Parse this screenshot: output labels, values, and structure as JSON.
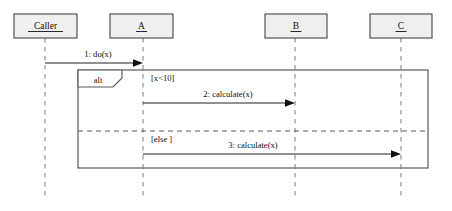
{
  "diagram": {
    "type": "uml-sequence-diagram",
    "title": "",
    "width": 452,
    "height": 211,
    "colors": {
      "background": "#ffffff",
      "lifeline_box_fill": "#efefef",
      "lifeline_box_stroke": "#444444",
      "lifeline_dash": "#9a9a9a",
      "fragment_stroke": "#5a5a5a",
      "message_stroke": "#222222",
      "text": "#111111"
    }
  },
  "lifelines": [
    {
      "id": "caller",
      "label": "Caller",
      "underlined": true,
      "x": 45,
      "box": {
        "x": 14,
        "y": 14,
        "width": 63,
        "height": 24
      },
      "bottom_y": 196
    },
    {
      "id": "a",
      "label": "A",
      "underlined": true,
      "x": 143,
      "box": {
        "x": 110,
        "y": 14,
        "width": 63,
        "height": 24
      },
      "bottom_y": 196
    },
    {
      "id": "b",
      "label": "B",
      "underlined": true,
      "x": 295,
      "box": {
        "x": 265,
        "y": 14,
        "width": 62,
        "height": 24
      },
      "bottom_y": 196
    },
    {
      "id": "c",
      "label": "C",
      "underlined": true,
      "x": 401,
      "box": {
        "x": 370,
        "y": 14,
        "width": 62,
        "height": 24
      },
      "bottom_y": 196
    }
  ],
  "messages": [
    {
      "id": "msg-1",
      "sequence": "1",
      "label": "1: do(x)",
      "from": "caller",
      "to": "a",
      "from_x": 45,
      "to_x": 143,
      "y": 63,
      "label_x": 98,
      "label_y": 57,
      "arrow": "filled-solid"
    },
    {
      "id": "msg-2",
      "sequence": "2",
      "label": "2: calculate(x)",
      "from": "a",
      "to": "b",
      "from_x": 143,
      "to_x": 295,
      "y": 103,
      "label_x": 228,
      "label_y": 97,
      "arrow": "filled-solid"
    },
    {
      "id": "msg-3",
      "sequence": "3",
      "label": "3: calculate(x)",
      "from": "a",
      "to": "c",
      "from_x": 143,
      "to_x": 401,
      "y": 154,
      "label_x": 253,
      "label_y": 148,
      "arrow": "filled-solid"
    }
  ],
  "fragment": {
    "id": "alt-fragment",
    "operator": "alt",
    "x": 78,
    "y": 70,
    "width": 350,
    "height": 98,
    "tab": {
      "width": 44,
      "height": 17,
      "notch": 9
    },
    "tab_label_x": 98,
    "tab_label_y": 83,
    "divider_y": 131,
    "operands": [
      {
        "id": "operand-1",
        "guard": "[x<10]",
        "guard_x": 151,
        "guard_y": 81
      },
      {
        "id": "operand-2",
        "guard": "[else ]",
        "guard_x": 151,
        "guard_y": 142
      }
    ]
  }
}
